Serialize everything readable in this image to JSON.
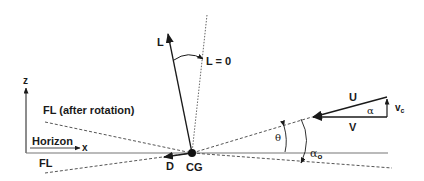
{
  "diagram": {
    "type": "aerodynamic force and angle diagram",
    "labels": {
      "lift": "L",
      "zero_lift": "L = 0",
      "z_axis": "z",
      "x_axis": "x",
      "horizon": "Horizon",
      "fl_after_rotation": "FL (after rotation)",
      "fl": "FL",
      "drag": "D",
      "center_of_gravity": "CG",
      "theta": "θ",
      "alpha_o": "α",
      "alpha_o_sub": "o",
      "u": "U",
      "v": "V",
      "alpha": "α",
      "vc": "v",
      "vc_sub": "c"
    },
    "colors": {
      "line": "#1a1a1a",
      "dashed": "#555555",
      "horizon": "#777777",
      "background": "#ffffff"
    }
  }
}
